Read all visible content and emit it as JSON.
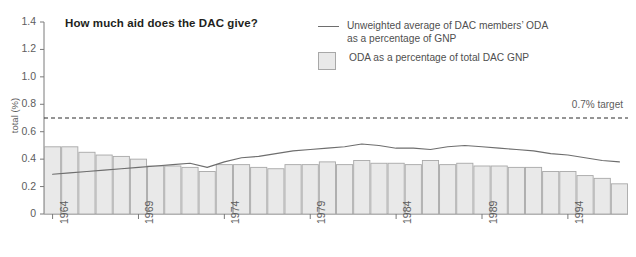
{
  "chart_data": {
    "type": "bar",
    "title": "How much aid does the DAC give?",
    "xlabel": "",
    "ylabel": "total (%)",
    "ylim": [
      0,
      1.4
    ],
    "ytick_labels": [
      "1.4",
      "1.2",
      "1.0",
      "0.8",
      "0.6",
      "0.4",
      "0.2",
      "0"
    ],
    "ytick_values": [
      1.4,
      1.2,
      1.0,
      0.8,
      0.6,
      0.4,
      0.2,
      0
    ],
    "grid": false,
    "legend_position": "top-right",
    "categories": [
      "1964",
      "1965",
      "1966",
      "1967",
      "1968",
      "1969",
      "1970",
      "1971",
      "1972",
      "1973",
      "1974",
      "1975",
      "1976",
      "1977",
      "1978",
      "1979",
      "1980",
      "1981",
      "1982",
      "1983",
      "1984",
      "1985",
      "1986",
      "1987",
      "1988",
      "1989",
      "1990",
      "1991",
      "1992",
      "1993",
      "1994",
      "1995",
      "1996",
      "1997"
    ],
    "xtick_labels": [
      "1964",
      "1969",
      "1974",
      "1979",
      "1984",
      "1989",
      "1994"
    ],
    "series": [
      {
        "name": "ODA as a percentage of total DAC GNP",
        "type": "bar",
        "values": [
          0.49,
          0.49,
          0.45,
          0.43,
          0.42,
          0.4,
          0.35,
          0.35,
          0.34,
          0.31,
          0.36,
          0.36,
          0.34,
          0.33,
          0.36,
          0.36,
          0.38,
          0.36,
          0.39,
          0.37,
          0.37,
          0.36,
          0.39,
          0.36,
          0.37,
          0.35,
          0.35,
          0.34,
          0.34,
          0.31,
          0.31,
          0.28,
          0.26,
          0.22
        ]
      },
      {
        "name": "Unweighted average of DAC members' ODA as a percentage of GNP",
        "type": "line",
        "values": [
          0.29,
          0.3,
          0.31,
          0.32,
          0.33,
          0.34,
          0.35,
          0.36,
          0.37,
          0.34,
          0.38,
          0.41,
          0.42,
          0.44,
          0.46,
          0.47,
          0.48,
          0.49,
          0.51,
          0.5,
          0.48,
          0.48,
          0.47,
          0.49,
          0.5,
          0.49,
          0.48,
          0.47,
          0.46,
          0.44,
          0.43,
          0.41,
          0.39,
          0.38
        ]
      }
    ],
    "annotations": [
      {
        "name": "target-line",
        "label": "0.7% target",
        "value": 0.7,
        "style": "dashed"
      }
    ]
  },
  "legend": {
    "line_entry": "Unweighted average of DAC members’ ODA as a percentage of GNP",
    "line_entry_l1": "Unweighted average of DAC members’ ODA",
    "line_entry_l2": "as a percentage of GNP",
    "bar_entry": "ODA as a percentage of total DAC GNP"
  },
  "colors": {
    "bar_fill": "#e9e9e9",
    "bar_stroke": "#a8a8a8",
    "line": "#6e6e6e",
    "axis": "#7a7a7a",
    "text": "#5d5d5d",
    "title": "#231f20",
    "target_line": "#2b2b2b",
    "background": "#ffffff"
  }
}
